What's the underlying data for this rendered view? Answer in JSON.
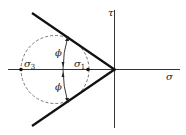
{
  "diagram": {
    "type": "Mohr-Coulomb failure envelope diagram",
    "axes": {
      "horizontal_label": "σ",
      "vertical_label": "τ"
    },
    "points": {
      "sigma3_label": "σ",
      "sigma3_sub": "3",
      "sigma1_label": "σ",
      "sigma1_sub": "1"
    },
    "angles": {
      "upper_label": "ϕ",
      "lower_label": "ϕ"
    },
    "colors": {
      "line": "#111111",
      "circle": "#555555",
      "background": "#ffffff"
    }
  }
}
